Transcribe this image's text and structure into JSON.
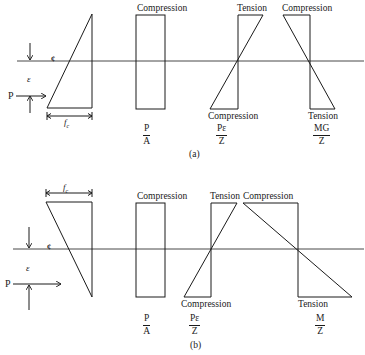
{
  "figure": {
    "panel_a": {
      "caption": "(a)",
      "labels": {
        "pa_top": "Compression",
        "pez_top": "Tension",
        "pez_bottom": "Compression",
        "mgz_top": "Compression",
        "mgz_bottom": "Tension"
      },
      "fractions": {
        "pa": {
          "num": "P",
          "den": "A"
        },
        "pez": {
          "num": "Pε",
          "den": "Z"
        },
        "mgz": {
          "num": "MG",
          "den": "Z"
        }
      },
      "symbols": {
        "centroid": "¢",
        "eccentricity": "ε",
        "force": "P",
        "stress": "f",
        "stress_sub": "c"
      }
    },
    "panel_b": {
      "caption": "(b)",
      "labels": {
        "pa_top": "Compression",
        "pez_top": "Tension",
        "pez_bottom": "Compression",
        "mz_top": "Compression",
        "mz_bottom": "Tension"
      },
      "fractions": {
        "pa": {
          "num": "P",
          "den": "A"
        },
        "pez": {
          "num": "Pε",
          "den": "Z"
        },
        "mz": {
          "num": "M",
          "den": "Z"
        }
      },
      "symbols": {
        "centroid": "¢",
        "eccentricity": "ε",
        "force": "P",
        "stress": "f",
        "stress_sub": "c"
      }
    },
    "colors": {
      "line": "#1a1a1a",
      "background": "#ffffff"
    }
  }
}
